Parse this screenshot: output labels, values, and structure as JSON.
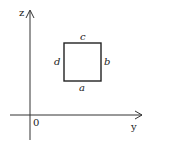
{
  "diagram": {
    "axes": {
      "vertical_label": "z",
      "horizontal_label": "y",
      "origin_label": "0"
    },
    "square": {
      "sides": {
        "bottom": "a",
        "right": "b",
        "top": "c",
        "left": "d"
      }
    },
    "colors": {
      "line": "#222222",
      "background": "#ffffff"
    }
  }
}
